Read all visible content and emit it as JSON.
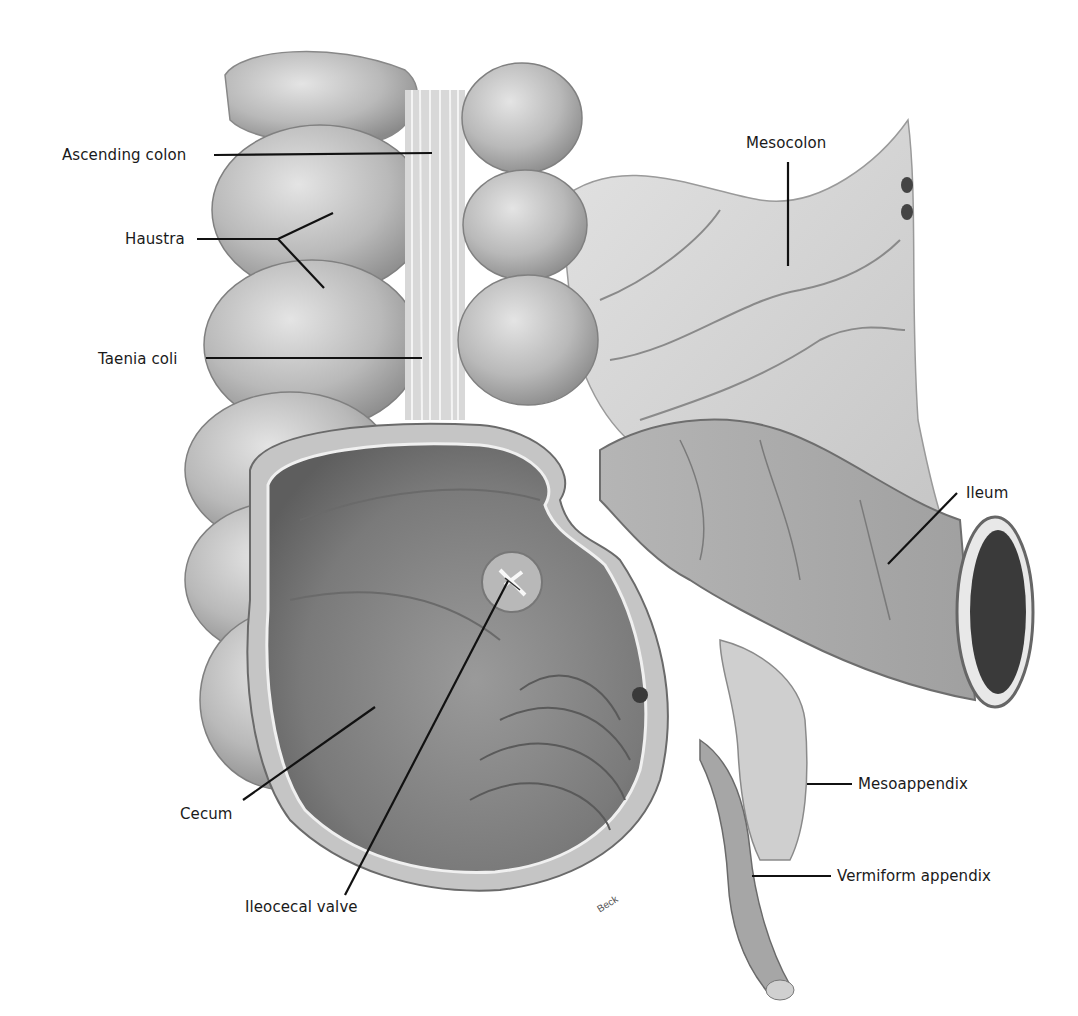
{
  "figure": {
    "style": "grayscale anatomical illustration",
    "colors": {
      "background": "#ffffff",
      "tissue_light": "#d6d6d6",
      "tissue_mid": "#a8a8a8",
      "tissue_dark": "#6e6e6e",
      "lumen_dark": "#3a3a3a",
      "leader_line": "#111111",
      "label_text": "#1a1a1a"
    },
    "signature": "Beck"
  },
  "labels": [
    {
      "id": "ascending-colon",
      "text": "Ascending colon",
      "x": 62,
      "y": 146,
      "leaders": [
        [
          214,
          155,
          432,
          153
        ]
      ]
    },
    {
      "id": "haustra",
      "text": "Haustra",
      "x": 125,
      "y": 230,
      "leaders": [
        [
          197,
          239,
          278,
          239
        ],
        [
          278,
          239,
          333,
          213
        ],
        [
          278,
          239,
          324,
          288
        ]
      ]
    },
    {
      "id": "taenia-coli",
      "text": "Taenia coli",
      "x": 98,
      "y": 352,
      "leaders": [
        [
          206,
          358,
          422,
          358
        ]
      ]
    },
    {
      "id": "mesocolon",
      "text": "Mesocolon",
      "x": 746,
      "y": 134,
      "leaders": [
        [
          788,
          162,
          788,
          266
        ]
      ]
    },
    {
      "id": "ileum",
      "text": "Ileum",
      "x": 966,
      "y": 488,
      "leaders": [
        [
          957,
          493,
          888,
          564
        ]
      ]
    },
    {
      "id": "mesoappendix",
      "text": "Mesoappendix",
      "x": 858,
      "y": 775,
      "leaders": [
        [
          807,
          784,
          852,
          784
        ]
      ]
    },
    {
      "id": "vermiform-appendix",
      "text": "Vermiform appendix",
      "x": 837,
      "y": 868,
      "leaders": [
        [
          752,
          876,
          831,
          876
        ]
      ]
    },
    {
      "id": "cecum",
      "text": "Cecum",
      "x": 180,
      "y": 805,
      "leaders": [
        [
          243,
          800,
          375,
          707
        ]
      ]
    },
    {
      "id": "ileocecal-valve",
      "text": "Ileocecal valve",
      "x": 245,
      "y": 898,
      "leaders": [
        [
          345,
          895,
          508,
          581
        ]
      ]
    }
  ]
}
